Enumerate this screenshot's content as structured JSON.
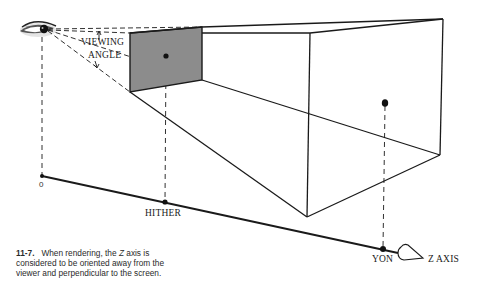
{
  "figure": {
    "labels": {
      "viewing": "VIEWING",
      "angle": "ANGLE",
      "origin": "0",
      "hither": "HITHER",
      "yon": "YON",
      "z_axis": "Z AXIS"
    },
    "caption": {
      "number": "11-7.",
      "text_before_z": "When rendering, the",
      "z": "Z",
      "text_after_z": "axis is considered to be oriented away from the viewer and perpendicular to the screen."
    },
    "colors": {
      "line": "#1a1a1a",
      "screen_fill": "#8c8c8c",
      "background": "#ffffff"
    },
    "icons": {
      "eye": "eye-icon",
      "viewer_cone": "viewing-cone-icon"
    }
  }
}
